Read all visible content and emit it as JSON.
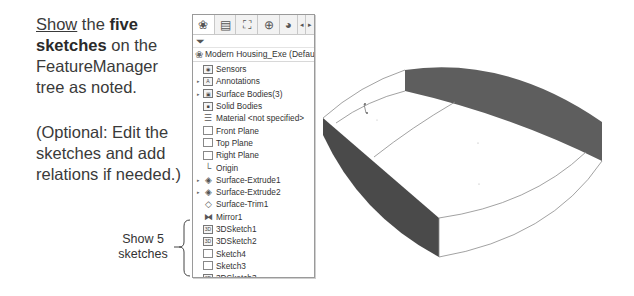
{
  "instructions": {
    "show_word": "Show",
    "the": " the ",
    "five_sketches_bold_1": "five",
    "five_sketches_bold_2": "sketches",
    "rest": " on the FeatureManager tree as noted.",
    "optional": "(Optional: Edit the sketches and add relations if needed.)"
  },
  "callout": {
    "label": "Show 5 sketches"
  },
  "feature_manager": {
    "toolbar_icons": [
      "feature-manager-icon",
      "property-manager-icon",
      "configuration-manager-icon",
      "dimxpert-icon",
      "display-manager-icon",
      "scroll-left-icon",
      "scroll-right-icon"
    ],
    "filter_icon": "filter-icon",
    "header": "Modern Housing_Exe (Default<<Defa",
    "items": [
      {
        "label": "Sensors",
        "icon": "sensors-icon",
        "expandable": false
      },
      {
        "label": "Annotations",
        "icon": "annotations-icon",
        "expandable": true
      },
      {
        "label": "Surface Bodies(3)",
        "icon": "surface-bodies-icon",
        "expandable": true
      },
      {
        "label": "Solid Bodies",
        "icon": "solid-bodies-icon",
        "expandable": false
      },
      {
        "label": "Material <not specified>",
        "icon": "material-icon",
        "expandable": false
      },
      {
        "label": "Front Plane",
        "icon": "plane-icon",
        "expandable": false
      },
      {
        "label": "Top Plane",
        "icon": "plane-icon",
        "expandable": false
      },
      {
        "label": "Right Plane",
        "icon": "plane-icon",
        "expandable": false
      },
      {
        "label": "Origin",
        "icon": "origin-icon",
        "expandable": false
      },
      {
        "label": "Surface-Extrude1",
        "icon": "surface-extrude-icon",
        "expandable": true
      },
      {
        "label": "Surface-Extrude2",
        "icon": "surface-extrude-icon",
        "expandable": true
      },
      {
        "label": "Surface-Trim1",
        "icon": "surface-trim-icon",
        "expandable": false
      },
      {
        "label": "Mirror1",
        "icon": "mirror-icon",
        "expandable": false
      },
      {
        "label": "3DSketch1",
        "icon": "3d-sketch-icon",
        "expandable": false
      },
      {
        "label": "3DSketch2",
        "icon": "3d-sketch-icon",
        "expandable": false
      },
      {
        "label": "Sketch4",
        "icon": "sketch-icon",
        "expandable": false
      },
      {
        "label": "Sketch3",
        "icon": "sketch-icon",
        "expandable": false
      },
      {
        "label": "3DSketch3",
        "icon": "3d-sketch-icon",
        "expandable": false
      }
    ]
  },
  "model": {
    "colors": {
      "dark_face": "#4a4a4a",
      "top_face": "#5e5e5e",
      "edge": "#777777"
    }
  }
}
